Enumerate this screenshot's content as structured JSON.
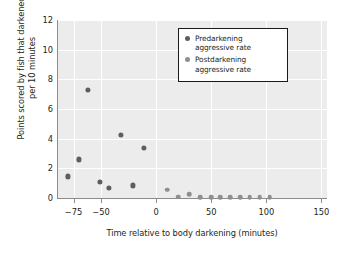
{
  "chart_data": {
    "type": "scatter",
    "title": "",
    "xlabel": "Time relative to body darkening (minutes)",
    "ylabel": "Points scored by fish that darkened\nper 10 minutes",
    "xlim": [
      -90,
      155
    ],
    "ylim": [
      0,
      12
    ],
    "xticks": [
      -75,
      -50,
      0,
      50,
      100,
      150
    ],
    "xtick_labels": [
      "−75",
      "−50",
      "0",
      "50",
      "100",
      "150"
    ],
    "yticks": [
      0,
      2,
      4,
      6,
      8,
      10,
      12
    ],
    "ytick_labels": [
      "0",
      "2",
      "4",
      "6",
      "8",
      "10",
      "12"
    ],
    "grid": true,
    "legend_position": "upper center-right",
    "series": [
      {
        "name": "Predarkening\naggressive rate",
        "color": "#5e5e5e",
        "points": [
          [
            -80,
            1.45
          ],
          [
            -70,
            2.6
          ],
          [
            -62,
            7.3
          ],
          [
            -51,
            1.1
          ],
          [
            -43,
            0.7
          ],
          [
            -32,
            4.25
          ],
          [
            -21,
            0.85
          ],
          [
            -11,
            3.4
          ]
        ]
      },
      {
        "name": "Postdarkening\naggressive rate",
        "color": "#8f8f8f",
        "points": [
          [
            10,
            0.55
          ],
          [
            20,
            0.08
          ],
          [
            30,
            0.25
          ],
          [
            40,
            0.07
          ],
          [
            50,
            0.07
          ],
          [
            58,
            0.07
          ],
          [
            67,
            0.07
          ],
          [
            76,
            0.07
          ],
          [
            85,
            0.07
          ],
          [
            94,
            0.07
          ],
          [
            103,
            0.07
          ]
        ]
      }
    ]
  }
}
